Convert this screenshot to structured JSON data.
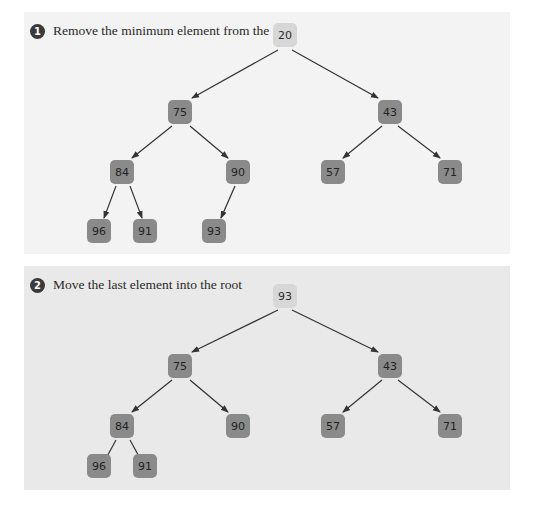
{
  "colors": {
    "panel1_bg": "#f3f3f3",
    "panel2_bg": "#e9e9e9",
    "node": "#8a8a8a",
    "root_node": "#d7d7d7",
    "edge": "#333333"
  },
  "panels": [
    {
      "step_number": "1",
      "label": "Remove the minimum element from the root",
      "nodes": [
        {
          "id": "n0",
          "value": "20",
          "role": "root"
        },
        {
          "id": "n1",
          "value": "75"
        },
        {
          "id": "n2",
          "value": "43"
        },
        {
          "id": "n3",
          "value": "84"
        },
        {
          "id": "n4",
          "value": "90"
        },
        {
          "id": "n5",
          "value": "57"
        },
        {
          "id": "n6",
          "value": "71"
        },
        {
          "id": "n7",
          "value": "96"
        },
        {
          "id": "n8",
          "value": "91"
        },
        {
          "id": "n9",
          "value": "93"
        }
      ],
      "edges": [
        [
          "20",
          "75"
        ],
        [
          "20",
          "43"
        ],
        [
          "75",
          "84"
        ],
        [
          "75",
          "90"
        ],
        [
          "43",
          "57"
        ],
        [
          "43",
          "71"
        ],
        [
          "84",
          "96"
        ],
        [
          "84",
          "91"
        ],
        [
          "90",
          "93"
        ]
      ]
    },
    {
      "step_number": "2",
      "label": "Move the last element into the root",
      "nodes": [
        {
          "id": "n0",
          "value": "93",
          "role": "root"
        },
        {
          "id": "n1",
          "value": "75"
        },
        {
          "id": "n2",
          "value": "43"
        },
        {
          "id": "n3",
          "value": "84"
        },
        {
          "id": "n4",
          "value": "90"
        },
        {
          "id": "n5",
          "value": "57"
        },
        {
          "id": "n6",
          "value": "71"
        },
        {
          "id": "n7",
          "value": "96"
        },
        {
          "id": "n8",
          "value": "91"
        }
      ],
      "edges": [
        [
          "93",
          "75"
        ],
        [
          "93",
          "43"
        ],
        [
          "75",
          "84"
        ],
        [
          "75",
          "90"
        ],
        [
          "43",
          "57"
        ],
        [
          "43",
          "71"
        ],
        [
          "84",
          "96"
        ],
        [
          "84",
          "91"
        ]
      ]
    }
  ]
}
